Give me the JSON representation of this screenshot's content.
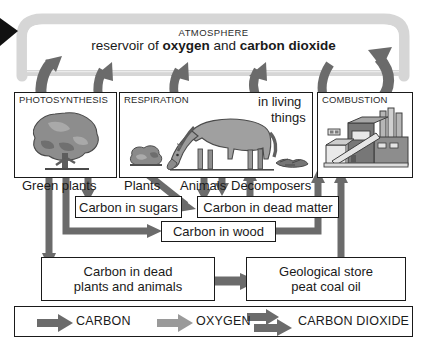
{
  "diagram": {
    "atmosphere": {
      "heading": "ATMOSPHERE",
      "line_prefix": "reservoir of ",
      "bold_1": "oxygen",
      "line_middle": " and ",
      "bold_2": "carbon dioxide"
    },
    "panels": [
      {
        "id": "photosynthesis",
        "title": "PHOTOSYNTHESIS",
        "caption": "Green plants"
      },
      {
        "id": "respiration",
        "title": "RESPIRATION",
        "caption_a": "Plants",
        "caption_b": "Animals",
        "caption_c": "Decomposers"
      },
      {
        "id": "living-things",
        "line1": "in living",
        "line2": "things"
      },
      {
        "id": "combustion",
        "title": "COMBUSTION"
      }
    ],
    "stores": [
      {
        "id": "carbon-in-sugars",
        "label": "Carbon in sugars"
      },
      {
        "id": "carbon-in-dead-matter",
        "label": "Carbon in dead matter"
      },
      {
        "id": "carbon-in-wood",
        "label": "Carbon in wood"
      },
      {
        "id": "carbon-in-dead-plants-and-animals",
        "line1": "Carbon in dead",
        "line2": "plants and animals"
      },
      {
        "id": "geological-store",
        "line1": "Geological store",
        "line2": "peat    coal    oil"
      }
    ],
    "legend": [
      {
        "id": "carbon",
        "label": "CARBON",
        "style": "single",
        "color": "#6b6b6b"
      },
      {
        "id": "oxygen",
        "label": "OXYGEN",
        "style": "single",
        "color": "#9a9a9a"
      },
      {
        "id": "carbon-dioxide",
        "label": "CARBON DIOXIDE",
        "style": "double",
        "color": "#6b6b6b"
      }
    ],
    "colors": {
      "carbon_arrow": "#6b6b6b",
      "oxygen_arrow": "#9a9a9a",
      "atmosphere_band": "#d6d6d6",
      "outline": "#1a1a1a",
      "panel_art_dark": "#6e6e6e",
      "panel_art_mid": "#8f8f8f",
      "panel_art_light": "#b9b9b9"
    }
  }
}
